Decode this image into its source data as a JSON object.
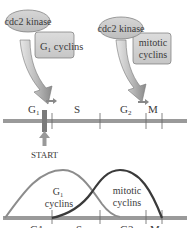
{
  "top_left_complex": {
    "kinase_label": "cdc2 kinase",
    "cyclin_label_main": "G",
    "cyclin_label_sub": "1",
    "cyclin_label_rest": " cyclins"
  },
  "top_right_complex": {
    "kinase_label": "cdc2 kinase",
    "cyclin_label_line1": "mitotic",
    "cyclin_label_line2": "cyclins"
  },
  "cell_cycle_axis": {
    "phases": [
      {
        "main": "G",
        "sub": "1"
      },
      {
        "main": "S",
        "sub": ""
      },
      {
        "main": "G",
        "sub": "2"
      },
      {
        "main": "M",
        "sub": ""
      }
    ],
    "checkpoint_label": "START"
  },
  "curves": {
    "g1_label_main": "G",
    "g1_label_sub": "1",
    "g1_label_line2": "cyclins",
    "mitotic_label_line1": "mitotic",
    "mitotic_label_line2": "cyclins"
  },
  "bottom_axis": {
    "phases": [
      "G1",
      "S",
      "G2",
      "M"
    ]
  },
  "colors": {
    "axis": "#9a9a9a",
    "ellipse_fill": "#c8c8c8",
    "box_fill": "#d2d2d2",
    "g1_curve": "#8c8c8c",
    "mitotic_curve": "#3a3a3a",
    "start_bar": "#7a7a7a"
  }
}
